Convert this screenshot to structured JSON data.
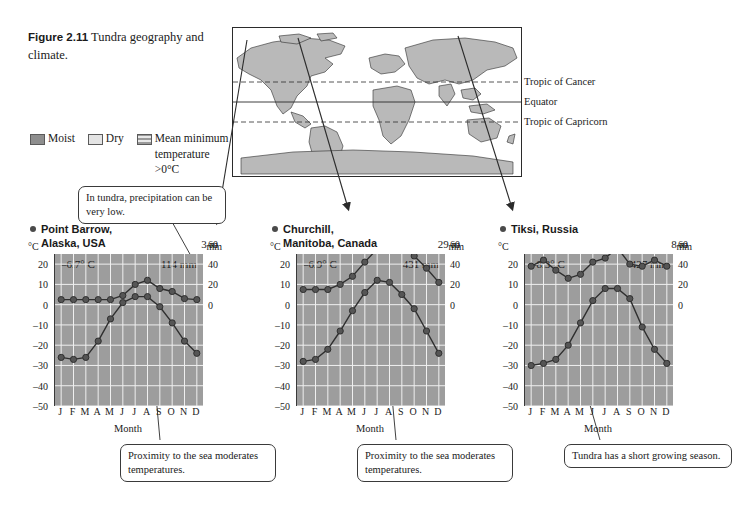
{
  "figure": {
    "number": "Figure 2.11",
    "title": "Tundra geography and climate."
  },
  "legend": {
    "items": [
      {
        "label": "Moist",
        "swatch": "moist-swatch"
      },
      {
        "label": "Dry",
        "swatch": "dry-swatch"
      },
      {
        "label": "Mean minimum temperature >0°C",
        "swatch": "mean-min-temp-swatch"
      }
    ]
  },
  "map": {
    "labels": [
      {
        "text": "Tropic of Cancer"
      },
      {
        "text": "Equator"
      },
      {
        "text": "Tropic of Capricorn"
      }
    ]
  },
  "callouts": {
    "precipitation": "In tundra, precipitation can be very low.",
    "sea_left": "Proximity to the sea moderates temperatures.",
    "sea_middle": "Proximity to the sea moderates temperatures.",
    "growing_season": "Tundra has a short growing season."
  },
  "axes": {
    "temp_unit": "°C",
    "precip_unit": "mm",
    "temp_ticks": [
      "20",
      "10",
      "0",
      "–10",
      "–20",
      "–30",
      "–40",
      "–50"
    ],
    "precip_ticks": [
      "60",
      "40",
      "20",
      "0"
    ],
    "months": [
      "J",
      "F",
      "M",
      "A",
      "M",
      "J",
      "J",
      "A",
      "S",
      "O",
      "N",
      "D"
    ],
    "month_label": "Month"
  },
  "chart_data": [
    {
      "type": "line",
      "title": "Point Barrow, Alaska, USA",
      "station_line1": "Point Barrow,",
      "station_line2": "Alaska, USA",
      "elevation": "3 m",
      "mean_temp": "–6.7° C",
      "annual_precip": "114 mm",
      "xlabel": "Month",
      "ylabel": "°C",
      "y2label": "mm",
      "categories": [
        "J",
        "F",
        "M",
        "A",
        "M",
        "J",
        "J",
        "A",
        "S",
        "O",
        "N",
        "D"
      ],
      "ylim": [
        -50,
        25
      ],
      "y2lim": [
        0,
        70
      ],
      "grid": true,
      "series": [
        {
          "name": "Temperature",
          "unit": "°C",
          "values": [
            -26,
            -27,
            -26,
            -18,
            -7,
            1,
            4,
            4,
            -1,
            -9,
            -18,
            -24
          ]
        },
        {
          "name": "Precipitation",
          "unit": "mm",
          "values": [
            5,
            5,
            5,
            5,
            5,
            9,
            20,
            24,
            16,
            13,
            6,
            5
          ]
        }
      ]
    },
    {
      "type": "line",
      "title": "Churchill, Manitoba, Canada",
      "station_line1": "Churchill,",
      "station_line2": "Manitoba, Canada",
      "elevation": "29 m",
      "mean_temp": "–6.9° C",
      "annual_precip": "431 mm",
      "xlabel": "Month",
      "ylabel": "°C",
      "y2label": "mm",
      "categories": [
        "J",
        "F",
        "M",
        "A",
        "M",
        "J",
        "J",
        "A",
        "S",
        "O",
        "N",
        "D"
      ],
      "ylim": [
        -50,
        25
      ],
      "y2lim": [
        0,
        70
      ],
      "grid": true,
      "series": [
        {
          "name": "Temperature",
          "unit": "°C",
          "values": [
            -28,
            -27,
            -22,
            -13,
            -3,
            6,
            12,
            11,
            5,
            -2,
            -13,
            -24
          ]
        },
        {
          "name": "Precipitation",
          "unit": "mm",
          "values": [
            15,
            15,
            15,
            20,
            28,
            42,
            55,
            65,
            60,
            48,
            36,
            22
          ]
        }
      ]
    },
    {
      "type": "line",
      "title": "Tiksi, Russia",
      "station_line1": "Tiksi, Russia",
      "station_line2": "",
      "elevation": "8 m",
      "mean_temp": "–8.3° C",
      "annual_precip": "427 mm",
      "xlabel": "Month",
      "ylabel": "°C",
      "y2label": "mm",
      "categories": [
        "J",
        "F",
        "M",
        "A",
        "M",
        "J",
        "J",
        "A",
        "S",
        "O",
        "N",
        "D"
      ],
      "ylim": [
        -50,
        25
      ],
      "y2lim": [
        0,
        70
      ],
      "grid": true,
      "series": [
        {
          "name": "Temperature",
          "unit": "°C",
          "values": [
            -30,
            -29,
            -27,
            -20,
            -9,
            2,
            8,
            8,
            3,
            -11,
            -22,
            -29
          ]
        },
        {
          "name": "Precipitation",
          "unit": "mm",
          "values": [
            38,
            44,
            34,
            26,
            30,
            42,
            46,
            56,
            40,
            38,
            44,
            38
          ]
        }
      ]
    }
  ]
}
